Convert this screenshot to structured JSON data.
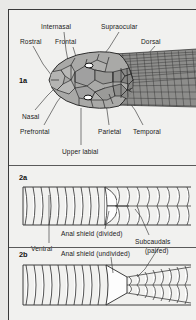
{
  "figure": {
    "panels": [
      {
        "id": "1a",
        "number": "1a",
        "subject": "head-scales-dorsal-view",
        "labels": [
          {
            "name": "internasal",
            "text": "Internasal"
          },
          {
            "name": "supraocular",
            "text": "Supraocular"
          },
          {
            "name": "rostral",
            "text": "Rostral"
          },
          {
            "name": "frontal",
            "text": "Frontal"
          },
          {
            "name": "dorsal",
            "text": "Dorsal"
          },
          {
            "name": "nasal",
            "text": "Nasal"
          },
          {
            "name": "prefrontal",
            "text": "Prefrontal"
          },
          {
            "name": "parietal",
            "text": "Parietal"
          },
          {
            "name": "temporal",
            "text": "Temporal"
          },
          {
            "name": "upper-labial",
            "text": "Upper labial"
          }
        ]
      },
      {
        "id": "2a",
        "number": "2a",
        "subject": "ventral-scales-anal-shield-divided",
        "labels": [
          {
            "name": "anal-shield-divided",
            "text": "Anal shield (divided)"
          },
          {
            "name": "ventral",
            "text": "Ventral"
          },
          {
            "name": "subcaudals-paired-line1",
            "text": "Subcaudals"
          },
          {
            "name": "subcaudals-paired-line2",
            "text": "(paired)"
          }
        ]
      },
      {
        "id": "2b",
        "number": "2b",
        "subject": "ventral-scales-anal-shield-undivided",
        "labels": [
          {
            "name": "anal-shield-undivided",
            "text": "Anal shield (undivided)"
          }
        ]
      }
    ]
  },
  "colors": {
    "page_background": "#e9e9e7",
    "plate_background": "#f1f1ef",
    "ink": "#1a1a1a",
    "scale_fill_light": "#b9b9b7",
    "scale_fill_mid": "#9a9a98",
    "scale_fill_dark": "#6f6f6d",
    "outline": "#2a2a2a"
  }
}
